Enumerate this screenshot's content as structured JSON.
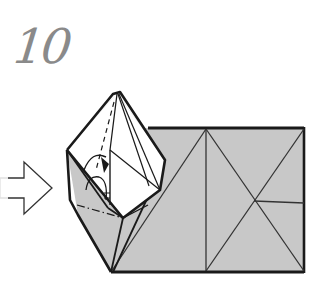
{
  "step": {
    "number": "10"
  },
  "diagram": {
    "type": "origami-folding-step",
    "icons": [
      "push-arrow-icon",
      "open-arrow-icon",
      "dash-dot-fold-line"
    ],
    "colors": {
      "paper_fill": "#c8c8c8",
      "paper_white": "#ffffff",
      "line": "#1a1a1a",
      "step_number": "#8a8a8a",
      "arrow_outline": "#333333"
    }
  }
}
